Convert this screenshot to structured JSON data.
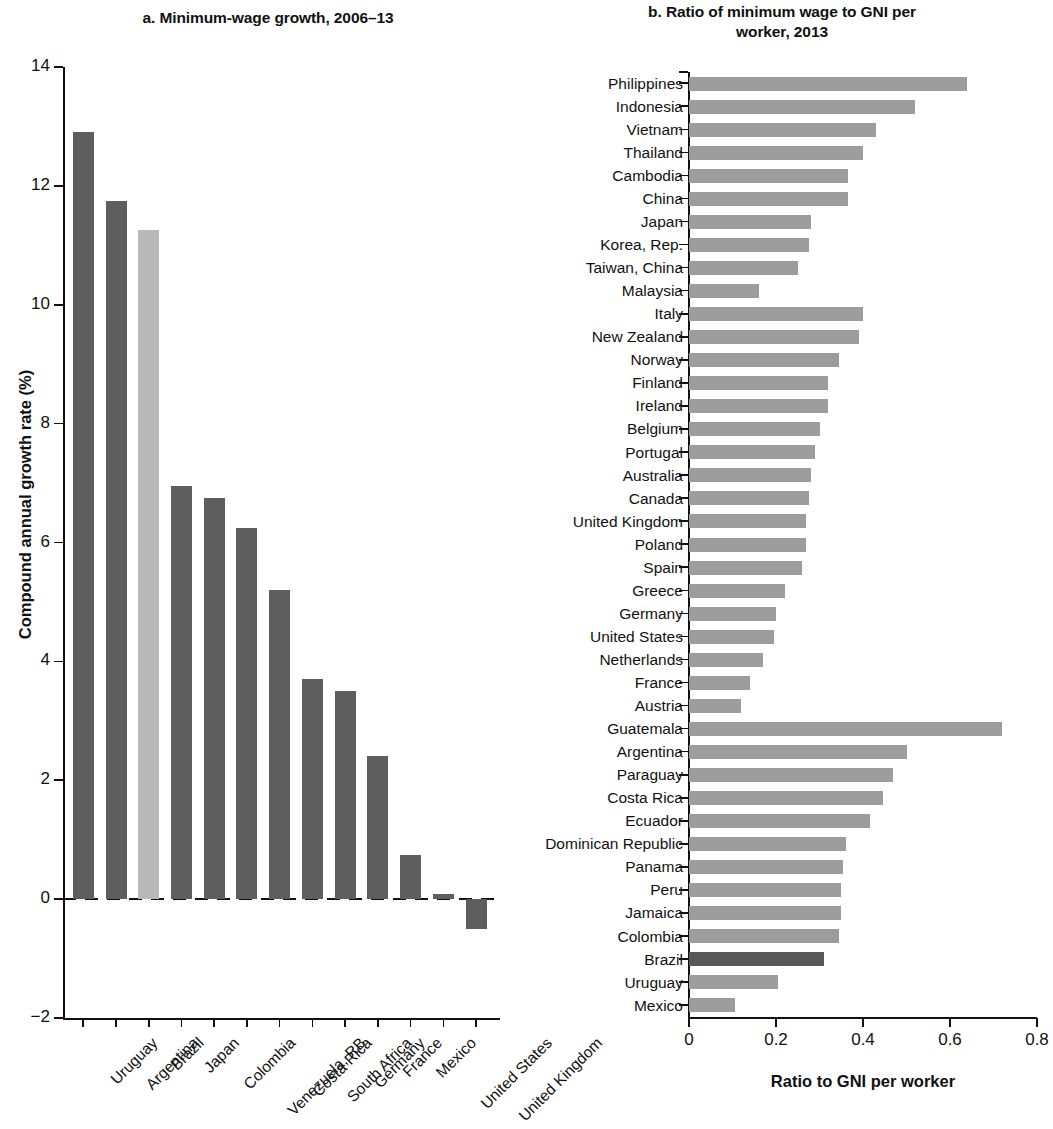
{
  "colors": {
    "bar_default": "#5e5e5e",
    "bar_highlight_a": "#b9b9b9",
    "bar_default_b": "#9d9d9d",
    "bar_highlight_b": "#585858",
    "axis": "#111111"
  },
  "panel_a": {
    "title": "a. Minimum-wage growth, 2006–13",
    "ylabel": "Compound annual growth rate (%)",
    "yticks": [
      "14",
      "12",
      "10",
      "8",
      "6",
      "4",
      "2",
      "0",
      "−2"
    ]
  },
  "panel_b": {
    "title_line1": "b. Ratio of minimum wage to GNI per",
    "title_line2": "worker, 2013",
    "xlabel": "Ratio to GNI per worker",
    "xticks": [
      "0",
      "0.2",
      "0.4",
      "0.6",
      "0.8"
    ]
  },
  "chart_data": [
    {
      "type": "bar",
      "panel": "a",
      "title": "a. Minimum-wage growth, 2006–13",
      "xlabel": "",
      "ylabel": "Compound annual growth rate (%)",
      "ylim": [
        -2,
        14
      ],
      "ytick_values": [
        14,
        12,
        10,
        8,
        6,
        4,
        2,
        0,
        -2
      ],
      "grid": false,
      "legend": "none",
      "orientation": "vertical",
      "zero_line": "dashed",
      "highlight_category": "Brazil",
      "categories": [
        "Uruguay",
        "Argentina",
        "Brazil",
        "Japan",
        "Colombia",
        "Venezuela, RB",
        "Costa Rica",
        "South Africa",
        "Germany",
        "France",
        "Mexico",
        "United States",
        "United Kingdom"
      ],
      "values": [
        12.9,
        11.75,
        11.25,
        6.95,
        6.75,
        6.25,
        5.2,
        3.7,
        3.5,
        2.4,
        0.75,
        0.08,
        -0.5
      ]
    },
    {
      "type": "bar",
      "panel": "b",
      "title": "b. Ratio of minimum wage to GNI per worker, 2013",
      "xlabel": "Ratio to GNI per worker",
      "ylabel": "",
      "xlim": [
        0,
        0.8
      ],
      "xtick_values": [
        0,
        0.2,
        0.4,
        0.6,
        0.8
      ],
      "grid": false,
      "legend": "none",
      "orientation": "horizontal",
      "highlight_category": "Brazil",
      "categories": [
        "Philippines",
        "Indonesia",
        "Vietnam",
        "Thailand",
        "Cambodia",
        "China",
        "Japan",
        "Korea, Rep.",
        "Taiwan, China",
        "Malaysia",
        "Italy",
        "New Zealand",
        "Norway",
        "Finland",
        "Ireland",
        "Belgium",
        "Portugal",
        "Australia",
        "Canada",
        "United Kingdom",
        "Poland",
        "Spain",
        "Greece",
        "Germany",
        "United States",
        "Netherlands",
        "France",
        "Austria",
        "Guatemala",
        "Argentina",
        "Paraguay",
        "Costa Rica",
        "Ecuador",
        "Dominican Republic",
        "Panama",
        "Peru",
        "Jamaica",
        "Colombia",
        "Brazil",
        "Uruguay",
        "Mexico"
      ],
      "values": [
        0.64,
        0.52,
        0.43,
        0.4,
        0.365,
        0.365,
        0.28,
        0.275,
        0.25,
        0.16,
        0.4,
        0.39,
        0.345,
        0.32,
        0.32,
        0.3,
        0.29,
        0.28,
        0.275,
        0.27,
        0.27,
        0.26,
        0.22,
        0.2,
        0.195,
        0.17,
        0.14,
        0.12,
        0.72,
        0.5,
        0.47,
        0.445,
        0.415,
        0.36,
        0.355,
        0.35,
        0.35,
        0.345,
        0.31,
        0.205,
        0.105
      ]
    }
  ]
}
